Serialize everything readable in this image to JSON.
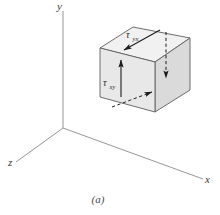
{
  "figure": {
    "caption": "(a)",
    "background_color": "#ffffff",
    "axes": {
      "color": "#7a7a7a",
      "origin_label": "",
      "items": [
        {
          "name": "y-axis",
          "label": "y",
          "direction": "up"
        },
        {
          "name": "x-axis",
          "label": "x",
          "direction": "lower-right"
        },
        {
          "name": "z-axis",
          "label": "z",
          "direction": "lower-left"
        }
      ]
    },
    "element": {
      "shape": "cube",
      "face_colors": {
        "front": "#e9e9e9",
        "top": "#f2f2f2",
        "right": "#dcdcdc"
      },
      "edge_color": "#5e5e5e"
    },
    "stress_labels": [
      {
        "name": "tau-yx",
        "symbol": "τ",
        "subscript": "yx",
        "face": "top",
        "arrow_style": "solid",
        "arrow_direction": "down-left"
      },
      {
        "name": "tau-xy",
        "symbol": "τ",
        "subscript": "xy",
        "face": "front",
        "arrow_style": "solid",
        "arrow_direction": "up"
      }
    ],
    "hidden_arrows": [
      {
        "name": "tau-yx-hidden",
        "arrow_style": "dashed",
        "arrow_direction": "down",
        "face": "back-right"
      },
      {
        "name": "tau-xy-hidden",
        "arrow_style": "dashed",
        "arrow_direction": "up-right",
        "face": "bottom"
      }
    ]
  }
}
